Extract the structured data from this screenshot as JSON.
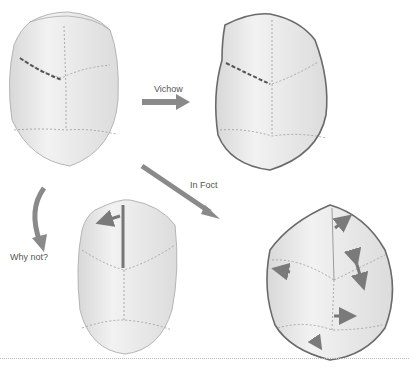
{
  "labels": {
    "virchow": "Vichow",
    "in_fact": "In Foct",
    "why_not": "Why not?"
  },
  "colors": {
    "skull_fill": "#ebebeb",
    "outline": "#6a6a6a",
    "suture": "#9a9a9a",
    "arrow": "#7a7a7a",
    "background": "#ffffff"
  },
  "panels": [
    {
      "id": "normal-skull",
      "position": "top-left"
    },
    {
      "id": "virchow-skull",
      "position": "top-right"
    },
    {
      "id": "why-not-skull",
      "position": "bottom-middle"
    },
    {
      "id": "in-fact-skull",
      "position": "bottom-right"
    }
  ]
}
